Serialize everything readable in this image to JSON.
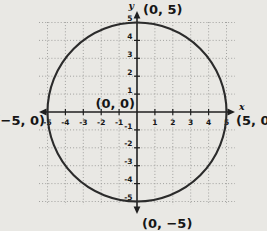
{
  "colors": {
    "background": "#e9e8e4",
    "axis": "#1f1f1f",
    "grid": "#9a9a97",
    "circle": "#2b2b2b",
    "text": "#161616"
  },
  "chart_data": {
    "type": "line",
    "title": "",
    "xlabel": "x",
    "ylabel": "y",
    "xlim": [
      -5.5,
      5.5
    ],
    "ylim": [
      -5.5,
      5.3
    ],
    "grid": true,
    "x_ticks": [
      -5,
      -4,
      -3,
      -2,
      -1,
      1,
      2,
      3,
      4,
      5
    ],
    "y_ticks": [
      5,
      4,
      3,
      2,
      1,
      -1,
      -2,
      -3,
      -4,
      -5
    ],
    "series": [
      {
        "name": "circle",
        "shape": "circle",
        "center": [
          0,
          0
        ],
        "radius": 5
      }
    ],
    "annotations": [
      {
        "text": "(0, 5)",
        "point": [
          0,
          5
        ],
        "position": "top"
      },
      {
        "text": "(0, 0)",
        "point": [
          0,
          0
        ],
        "position": "origin"
      },
      {
        "text": "(−5, 0)",
        "point": [
          -5,
          0
        ],
        "position": "left"
      },
      {
        "text": "(5, 0)",
        "point": [
          5,
          0
        ],
        "position": "right"
      },
      {
        "text": "(0, −5)",
        "point": [
          0,
          -5
        ],
        "position": "bottom"
      }
    ]
  }
}
